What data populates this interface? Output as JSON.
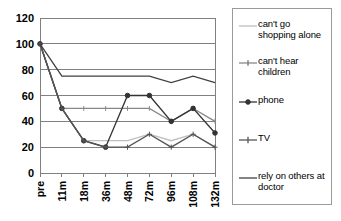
{
  "chart_data": {
    "type": "line",
    "title": "",
    "xlabel": "",
    "ylabel": "",
    "categories": [
      "pre",
      "11m",
      "18m",
      "36m",
      "48m",
      "72m",
      "96m",
      "108m",
      "132m"
    ],
    "ylim": [
      0,
      120
    ],
    "ytick_step": 20,
    "yticks": [
      "0",
      "20",
      "40",
      "60",
      "80",
      "100",
      "120"
    ],
    "grid": true,
    "legend_position": "right",
    "series": [
      {
        "name": "can't go shopping alone",
        "label_line1": "can't go",
        "label_line2": "shopping alone",
        "color": "#bfbfbf",
        "marker": "none",
        "values": [
          100,
          50,
          25,
          25,
          25,
          30,
          25,
          30,
          20
        ]
      },
      {
        "name": "can't hear children",
        "label_line1": "can't hear",
        "label_line2": "children",
        "color": "#888888",
        "marker": "tick",
        "values": [
          100,
          50,
          50,
          50,
          50,
          50,
          40,
          50,
          40
        ]
      },
      {
        "name": "phone",
        "label_line1": "phone",
        "label_line2": "",
        "color": "#333333",
        "marker": "circle",
        "values": [
          100,
          50,
          25,
          20,
          60,
          60,
          40,
          50,
          31
        ]
      },
      {
        "name": "TV",
        "label_line1": "TV",
        "label_line2": "",
        "color": "#555555",
        "marker": "plus",
        "values": [
          100,
          50,
          25,
          20,
          20,
          30,
          20,
          30,
          20
        ]
      },
      {
        "name": "rely on others at doctor",
        "label_line1": "rely on others at",
        "label_line2": "doctor",
        "color": "#404040",
        "marker": "none",
        "values": [
          100,
          75,
          75,
          75,
          75,
          75,
          70,
          75,
          70
        ]
      }
    ]
  },
  "legend": {
    "entries": [
      {
        "label": "can't go\nshopping alone"
      },
      {
        "label": "can't hear\nchildren"
      },
      {
        "label": "phone"
      },
      {
        "label": "TV"
      },
      {
        "label": "rely on others at\ndoctor"
      }
    ]
  }
}
